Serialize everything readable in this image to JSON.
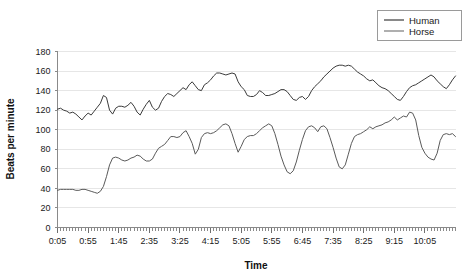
{
  "chart_data": {
    "type": "line",
    "title": "",
    "xlabel": "Time",
    "ylabel": "Beats per minute",
    "ylim": [
      0,
      180
    ],
    "ytick_step": 20,
    "yticks": [
      0,
      20,
      40,
      60,
      80,
      100,
      120,
      140,
      160,
      180
    ],
    "grid": true,
    "legend_position": "top-right",
    "xtick_labels": [
      "0:05",
      "0:55",
      "1:45",
      "2:35",
      "3:25",
      "4:15",
      "5:05",
      "5:55",
      "6:45",
      "7:35",
      "8:25",
      "9:15",
      "10:05"
    ],
    "x_index_range": [
      0,
      130
    ],
    "x_label_index_step": 10,
    "series": [
      {
        "name": "Human",
        "color": "#3b3b3b",
        "values": [
          121,
          122,
          120,
          119,
          117,
          118,
          116,
          113,
          110,
          114,
          117,
          115,
          119,
          123,
          127,
          135,
          133,
          120,
          116,
          122,
          124,
          124,
          123,
          125,
          128,
          124,
          118,
          115,
          121,
          126,
          130,
          123,
          120,
          122,
          129,
          134,
          137,
          136,
          134,
          137,
          140,
          143,
          141,
          146,
          149,
          145,
          141,
          140,
          146,
          148,
          151,
          155,
          158,
          158,
          157,
          156,
          157,
          158,
          157,
          149,
          144,
          141,
          135,
          134,
          134,
          136,
          140,
          138,
          135,
          135,
          136,
          137,
          139,
          141,
          141,
          139,
          135,
          131,
          130,
          133,
          134,
          131,
          134,
          140,
          144,
          147,
          150,
          154,
          157,
          160,
          163,
          165,
          166,
          166,
          165,
          166,
          165,
          162,
          159,
          157,
          155,
          152,
          150,
          151,
          148,
          145,
          143,
          142,
          140,
          137,
          134,
          131,
          130,
          134,
          139,
          143,
          145,
          146,
          148,
          150,
          152,
          154,
          156,
          154,
          150,
          147,
          144,
          142,
          146,
          151,
          155
        ]
      },
      {
        "name": "Horse",
        "color": "#5a5a5a",
        "values": [
          38,
          39,
          39,
          39,
          39,
          39,
          38,
          38,
          39,
          39,
          38,
          37,
          36,
          35,
          37,
          42,
          52,
          64,
          71,
          72,
          71,
          69,
          68,
          69,
          71,
          72,
          74,
          73,
          70,
          68,
          68,
          70,
          76,
          81,
          83,
          85,
          89,
          93,
          93,
          92,
          93,
          97,
          99,
          93,
          86,
          75,
          80,
          92,
          96,
          97,
          96,
          97,
          99,
          102,
          105,
          106,
          104,
          96,
          86,
          77,
          83,
          90,
          93,
          94,
          94,
          96,
          99,
          102,
          104,
          106,
          104,
          96,
          85,
          73,
          64,
          57,
          55,
          58,
          67,
          79,
          90,
          99,
          103,
          104,
          102,
          98,
          103,
          104,
          101,
          92,
          82,
          71,
          62,
          60,
          64,
          75,
          86,
          93,
          95,
          96,
          98,
          100,
          103,
          101,
          103,
          104,
          105,
          107,
          108,
          110,
          113,
          110,
          112,
          114,
          113,
          118,
          117,
          110,
          94,
          82,
          76,
          72,
          70,
          69,
          76,
          89,
          95,
          96,
          95,
          96,
          93
        ]
      }
    ]
  },
  "legend": {
    "items": [
      {
        "label": "Human"
      },
      {
        "label": "Horse"
      }
    ]
  },
  "axes": {
    "y_title": "Beats per minute",
    "x_title": "Time"
  }
}
